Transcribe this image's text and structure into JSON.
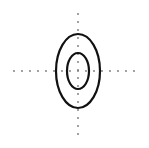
{
  "diagram": {
    "type": "concentric-ellipses-with-axes",
    "background": "#ffffff",
    "axes": {
      "color": "#777777",
      "dot_radius": 0.9,
      "dot_spacing": 8,
      "horizontal": {
        "y": 71,
        "x_start": 14,
        "x_end": 141
      },
      "vertical": {
        "x": 78,
        "y_start": 14,
        "y_end": 136
      }
    },
    "ellipses": [
      {
        "name": "outer",
        "cx": 78,
        "cy": 71,
        "rx": 22,
        "ry": 37,
        "stroke": "#111111",
        "stroke_width": 2.2
      },
      {
        "name": "inner",
        "cx": 78,
        "cy": 71,
        "rx": 11,
        "ry": 18,
        "stroke": "#111111",
        "stroke_width": 2.2
      }
    ]
  }
}
